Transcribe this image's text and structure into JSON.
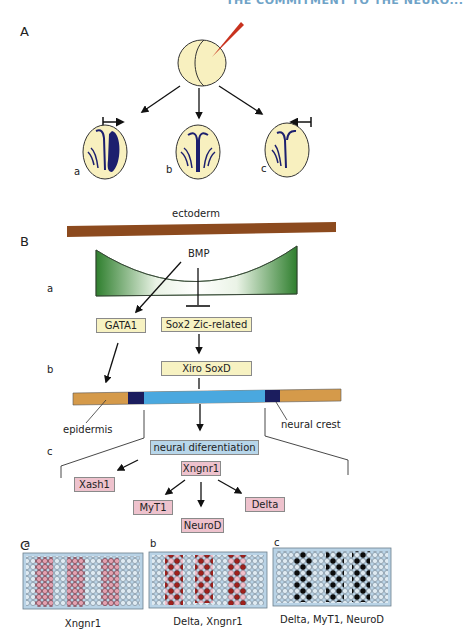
{
  "header": {
    "running_title": "THE COMMITMENT TO THE NEURO..."
  },
  "panel_a": {
    "letter": "A",
    "embryos": [
      {
        "sublabel": "a",
        "description": "injected side expanded neural plate",
        "arrow": "rightward inhibition arrow"
      },
      {
        "sublabel": "b",
        "description": "normal neural plate"
      },
      {
        "sublabel": "c",
        "description": "reduced neural plate",
        "arrow": "leftward inhibition arrow"
      }
    ]
  },
  "panel_b": {
    "letter": "B",
    "ectoderm_label": "ectoderm",
    "row_labels": {
      "a": "a",
      "b": "b",
      "c": "c"
    },
    "bmp_label": "BMP",
    "boxes": {
      "gata1": "GATA1",
      "sox2_zic": "Sox2   Zic-related",
      "xiro_soxd": "Xiro     SoxD",
      "neural_diff": "neural diferentiation",
      "xngnr1": "Xngnr1",
      "xash1": "Xash1",
      "myt1": "MyT1",
      "neurod": "NeuroD",
      "delta": "Delta"
    },
    "strip_labels": {
      "epidermis": "epidermis",
      "neural_crest": "neural crest"
    }
  },
  "panel_c": {
    "letter": "C",
    "grids": [
      {
        "sublabel": "a",
        "caption": "Xngnr1"
      },
      {
        "sublabel": "b",
        "caption": "Delta, Xngnr1"
      },
      {
        "sublabel": "c",
        "caption": "Delta, MyT1, NeuroD"
      }
    ]
  },
  "colors": {
    "embryo_fill": "#f8f0bf",
    "neural_plate": "#1c1f6e",
    "needle": "#c8321e",
    "ectoderm": "#8c4a1e",
    "bmp_green": "#3f8f3a",
    "epidermis_orange": "#d59a4a",
    "neural_blue": "#4aa8df",
    "dark_navy": "#1b1d5e",
    "grid_bg": "#b9d3e6",
    "pink_cell": "#e3a2b1",
    "red_cell": "#a0201c",
    "black_cell": "#0c0c0c"
  }
}
